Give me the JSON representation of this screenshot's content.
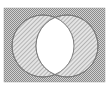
{
  "diagram": {
    "type": "venn",
    "universe": {
      "x": 4,
      "y": 8,
      "width": 101,
      "height": 74,
      "fill": "crosshatch",
      "color": "#9a9a9a"
    },
    "sets": [
      {
        "name": "A",
        "cx": 43,
        "cy": 46,
        "r": 31,
        "fill": "diagonal-hatch"
      },
      {
        "name": "B",
        "cx": 67,
        "cy": 46,
        "r": 31,
        "fill": "diagonal-hatch"
      }
    ],
    "intersection": {
      "fill": "#ffffff",
      "shaded": false
    },
    "colors": {
      "background": "#ffffff",
      "crosshatch_light": "#d8d8d8",
      "crosshatch_dark": "#8c8c8c",
      "hatch_light": "#e6e6e6",
      "hatch_dark": "#b0b0b0",
      "outline": "#7a7a7a"
    }
  }
}
